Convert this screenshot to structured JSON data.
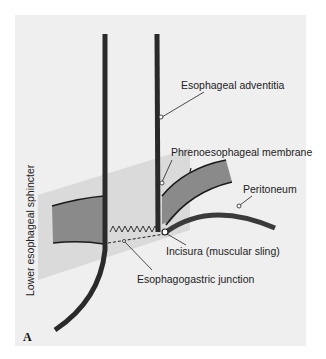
{
  "figure": {
    "panel_letter": "A",
    "labels": {
      "esophageal_adventitia": "Esophageal adventitia",
      "phrenoesophageal_membrane": "Phrenoesophageal membrane",
      "peritoneum": "Peritoneum",
      "incisura": "Incisura (muscular sling)",
      "esophagogastric_junction": "Esophagogastric junction",
      "lower_esophageal_sphincter": "Lower esophageal sphincter"
    },
    "colors": {
      "background": "#efefef",
      "wall": "#2a2a2a",
      "diaphragm": "#8a8a8a",
      "sphincter_zone": "#d6d6d6",
      "peritoneum": "#3a3a3a"
    }
  }
}
